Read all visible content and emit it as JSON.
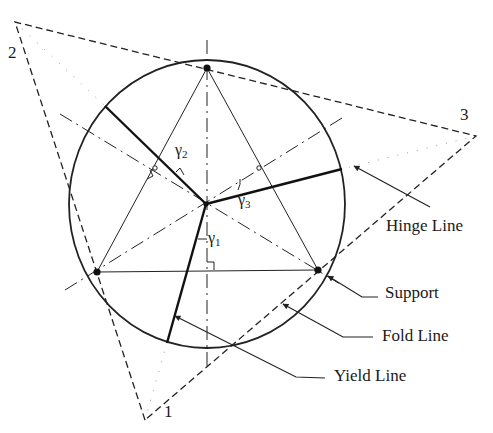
{
  "figure": {
    "width": 493,
    "height": 433,
    "background": "#ffffff",
    "stroke_color": "#222222"
  },
  "circle": {
    "cx": 207,
    "cy": 204,
    "rx": 138,
    "ry": 144
  },
  "center": {
    "x": 206,
    "y": 204
  },
  "supports": [
    {
      "name": "support-top",
      "x": 207,
      "y": 68
    },
    {
      "name": "support-left",
      "x": 97,
      "y": 272
    },
    {
      "name": "support-right",
      "x": 318,
      "y": 270
    }
  ],
  "outer_triangle": {
    "vertices": [
      {
        "id": "1",
        "x": 145,
        "y": 420
      },
      {
        "id": "2",
        "x": 15,
        "y": 22
      },
      {
        "id": "3",
        "x": 476,
        "y": 136
      }
    ]
  },
  "corner_labels": [
    {
      "text": "2",
      "x": 8,
      "y": 44
    },
    {
      "text": "3",
      "x": 460,
      "y": 106
    },
    {
      "text": "1",
      "x": 164,
      "y": 403
    }
  ],
  "angle_labels": [
    {
      "name": "gamma-2-label",
      "symbol": "γ",
      "sub": "2",
      "x": 175,
      "y": 142
    },
    {
      "name": "gamma-3-label",
      "symbol": "γ",
      "sub": "3",
      "x": 238,
      "y": 192
    },
    {
      "name": "gamma-1-label",
      "symbol": "γ",
      "sub": "1",
      "x": 208,
      "y": 230
    }
  ],
  "yield_lines": [
    {
      "name": "yield-line-2",
      "x1": 206,
      "y1": 204,
      "x2": 105,
      "y2": 106
    },
    {
      "name": "yield-line-3",
      "x1": 206,
      "y1": 204,
      "x2": 342,
      "y2": 169
    },
    {
      "name": "yield-line-1",
      "x1": 206,
      "y1": 204,
      "x2": 167,
      "y2": 343
    }
  ],
  "support_chords": [
    {
      "x1": 207,
      "y1": 68,
      "x2": 97,
      "y2": 272
    },
    {
      "x1": 207,
      "y1": 68,
      "x2": 318,
      "y2": 270
    },
    {
      "x1": 97,
      "y1": 272,
      "x2": 318,
      "y2": 270
    }
  ],
  "axis_lines": [
    {
      "name": "axis-vertical",
      "x1": 207,
      "y1": 40,
      "x2": 207,
      "y2": 370
    },
    {
      "name": "axis-upper-left",
      "x1": 60,
      "y1": 114,
      "x2": 340,
      "y2": 284
    },
    {
      "name": "axis-upper-right",
      "x1": 342,
      "y1": 118,
      "x2": 65,
      "y2": 290
    }
  ],
  "callouts": [
    {
      "name": "callout-hinge-line",
      "label": "Hinge Line",
      "label_x": 386,
      "label_y": 217,
      "points": [
        [
          430,
          207
        ],
        [
          354,
          166
        ]
      ]
    },
    {
      "name": "callout-support",
      "label": "Support",
      "label_x": 385,
      "label_y": 284,
      "points": [
        [
          378,
          297
        ],
        [
          362,
          297
        ],
        [
          328,
          276
        ]
      ]
    },
    {
      "name": "callout-fold-line",
      "label": "Fold Line",
      "label_x": 382,
      "label_y": 327,
      "points": [
        [
          373,
          337
        ],
        [
          343,
          337
        ],
        [
          283,
          304
        ]
      ]
    },
    {
      "name": "callout-yield-line",
      "label": "Yield Line",
      "label_x": 334,
      "label_y": 367,
      "points": [
        [
          325,
          378
        ],
        [
          296,
          377
        ],
        [
          175,
          316
        ]
      ]
    }
  ]
}
